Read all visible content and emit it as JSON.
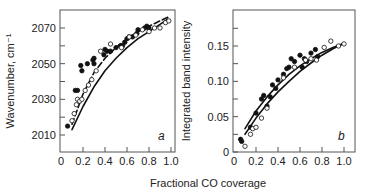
{
  "figure": {
    "shared_xlabel": "Fractional CO coverage"
  },
  "chart_data": [
    {
      "type": "scatter",
      "panel": "a",
      "title": "",
      "xlabel": "Fractional CO coverage",
      "ylabel": "Wavenumber, cm⁻¹",
      "xlim": [
        0,
        1.04
      ],
      "ylim": [
        2000,
        2080
      ],
      "xticks": [
        "0",
        "0.2",
        "0.4",
        "0.6",
        "0.8",
        "1.0"
      ],
      "yticks": [
        "2010",
        "2030",
        "2050",
        "2070"
      ],
      "grid": false,
      "legend": null,
      "series": [
        {
          "name": "filled circles",
          "marker": "filled",
          "x": [
            0.06,
            0.13,
            0.15,
            0.18,
            0.19,
            0.24,
            0.29,
            0.3,
            0.3,
            0.39,
            0.4,
            0.42,
            0.45,
            0.5,
            0.54,
            0.56,
            0.58,
            0.6,
            0.62,
            0.65,
            0.69,
            0.7,
            0.76,
            0.78,
            0.8
          ],
          "y": [
            2015,
            2035,
            2035,
            2049,
            2046,
            2050,
            2052,
            2050,
            2053,
            2055,
            2058,
            2057,
            2057,
            2059,
            2060,
            2060,
            2062,
            2064,
            2065,
            2065,
            2067,
            2069,
            2070,
            2071,
            2070
          ]
        },
        {
          "name": "open circles",
          "marker": "open",
          "x": [
            0.1,
            0.12,
            0.14,
            0.15,
            0.17,
            0.19,
            0.22,
            0.25,
            0.28,
            0.32,
            0.36,
            0.45,
            0.55,
            0.62,
            0.68,
            0.74,
            0.8,
            0.85,
            0.9,
            0.95,
            0.98
          ],
          "y": [
            2018,
            2022,
            2027,
            2030,
            2029,
            2030,
            2035,
            2038,
            2041,
            2046,
            2057,
            2061,
            2059,
            2065,
            2066,
            2069,
            2068,
            2070,
            2070,
            2073,
            2074
          ]
        },
        {
          "name": "dashed curve",
          "line": "dashed",
          "x": [
            0.1,
            0.2,
            0.3,
            0.4,
            0.5,
            0.6,
            0.7,
            0.8,
            0.9,
            0.97
          ],
          "y": [
            2016,
            2033,
            2045,
            2053,
            2059,
            2064,
            2068,
            2071,
            2074,
            2076
          ]
        },
        {
          "name": "solid curve",
          "line": "solid",
          "x": [
            0.1,
            0.2,
            0.3,
            0.4,
            0.5,
            0.6,
            0.7,
            0.8,
            0.9,
            0.97
          ],
          "y": [
            2013,
            2026,
            2037,
            2046,
            2053,
            2059,
            2064,
            2068,
            2072,
            2075
          ]
        }
      ],
      "annotation": "a"
    },
    {
      "type": "scatter",
      "panel": "b",
      "title": "",
      "xlabel": "Fractional CO coverage",
      "ylabel": "Integrated band intensity",
      "xlim": [
        0,
        1.05
      ],
      "ylim": [
        0,
        0.2
      ],
      "xticks": [
        "0",
        "0.2",
        "0.4",
        "0.6",
        "0.8",
        "1.0"
      ],
      "yticks": [
        "0",
        "0.05",
        "0.10",
        "0.15"
      ],
      "grid": false,
      "legend": null,
      "series": [
        {
          "name": "filled circles",
          "marker": "filled",
          "x": [
            0.06,
            0.07,
            0.15,
            0.2,
            0.25,
            0.27,
            0.3,
            0.33,
            0.35,
            0.38,
            0.4,
            0.45,
            0.48,
            0.5,
            0.52,
            0.55,
            0.6,
            0.62,
            0.64,
            0.66,
            0.7,
            0.74,
            0.76
          ],
          "y": [
            0.018,
            0.015,
            0.035,
            0.055,
            0.075,
            0.08,
            0.065,
            0.078,
            0.095,
            0.09,
            0.102,
            0.11,
            0.118,
            0.12,
            0.132,
            0.128,
            0.137,
            0.12,
            0.132,
            0.128,
            0.14,
            0.145,
            0.135
          ]
        },
        {
          "name": "open circles",
          "marker": "open",
          "x": [
            0.1,
            0.15,
            0.17,
            0.2,
            0.25,
            0.3,
            0.45,
            0.55,
            0.65,
            0.7,
            0.75,
            0.82,
            0.88,
            0.95,
            1.0
          ],
          "y": [
            0.008,
            0.025,
            0.033,
            0.035,
            0.048,
            0.062,
            0.105,
            0.12,
            0.13,
            0.132,
            0.13,
            0.148,
            0.157,
            0.15,
            0.153
          ]
        },
        {
          "name": "upper solid curve",
          "line": "solid",
          "x": [
            0.1,
            0.2,
            0.3,
            0.4,
            0.5,
            0.6,
            0.7,
            0.8,
            0.9,
            1.0
          ],
          "y": [
            0.033,
            0.058,
            0.078,
            0.095,
            0.11,
            0.122,
            0.132,
            0.141,
            0.148,
            0.154
          ]
        },
        {
          "name": "lower solid curve",
          "line": "solid",
          "x": [
            0.1,
            0.2,
            0.3,
            0.4,
            0.5,
            0.6,
            0.7,
            0.8,
            0.9,
            1.0
          ],
          "y": [
            0.025,
            0.048,
            0.068,
            0.085,
            0.1,
            0.114,
            0.126,
            0.137,
            0.146,
            0.154
          ]
        }
      ],
      "annotation": "b"
    }
  ]
}
